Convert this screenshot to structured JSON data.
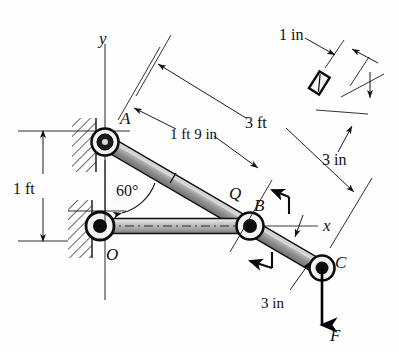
{
  "figure": {
    "background_color": "#fefefe",
    "ink_color": "#101010",
    "link_fill_color": "#9a9a9a",
    "link_fill_light": "#c9c9c9"
  },
  "labels": {
    "point_a": "A",
    "point_b": "B",
    "point_c": "C",
    "point_o": "O",
    "point_q": "Q",
    "axis_y": "y",
    "axis_x": "x",
    "force": "F"
  },
  "dimensions": {
    "vertical_1ft": "1 ft",
    "angle_60": "60°",
    "length_1ft9in": "1 ft 9 in",
    "length_3ft": "3 ft",
    "section_width_1in": "1 in",
    "section_depth_3in": "3 in",
    "link_depth_3in": "3 in"
  },
  "geometry": {
    "pin_a": {
      "x": 105,
      "y": 142
    },
    "pin_o": {
      "x": 100,
      "y": 226
    },
    "pin_b": {
      "x": 250,
      "y": 226
    },
    "pin_c": {
      "x": 322,
      "y": 268
    },
    "angle_degrees": 60
  },
  "annotations": {
    "rotation_arrow_upper": "curved-arrow-ccw",
    "rotation_arrow_lower": "curved-arrow-cw",
    "cross_section_inset": "rectangular-bar-section"
  }
}
